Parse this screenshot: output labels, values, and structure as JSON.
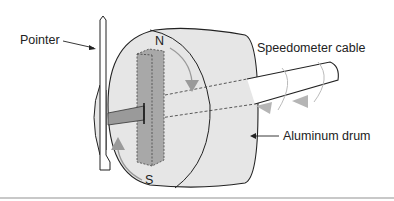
{
  "diagram": {
    "labels": {
      "pointer": "Pointer",
      "cable": "Speedometer cable",
      "drum": "Aluminum drum",
      "north": "N",
      "south": "S"
    },
    "colors": {
      "drum_fill": "#e6e6e6",
      "magnet_fill": "#a8a8a8",
      "arrow": "#9a9a9a",
      "line": "#222222",
      "divider": "#c8c8c8"
    }
  }
}
